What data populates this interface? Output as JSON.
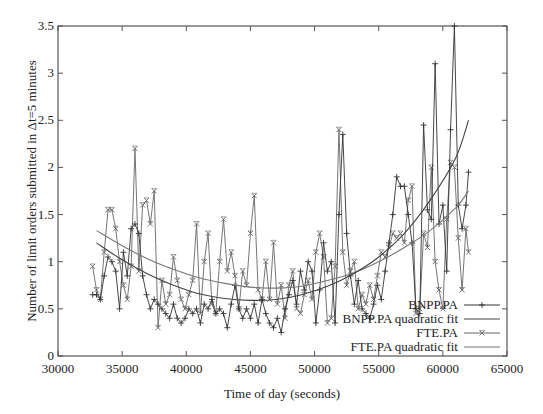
{
  "chart_data": {
    "type": "line",
    "title": "",
    "xlabel": "Time of day (seconds)",
    "ylabel": "Number of limit orders submitted in Δt=5 minutes",
    "xlim": [
      30000,
      65000
    ],
    "ylim": [
      0,
      3.5
    ],
    "grid": false,
    "legend_position": "bottom-right",
    "x_ticks": [
      "30000",
      "35000",
      "40000",
      "45000",
      "50000",
      "55000",
      "60000",
      "65000"
    ],
    "y_ticks": [
      "0",
      "0.5",
      "1",
      "1.5",
      "2",
      "2.5",
      "3",
      "3.5"
    ],
    "series": [
      {
        "name": "BNPP.PA",
        "marker": "+",
        "x": [
          32700,
          33000,
          33300,
          33600,
          33900,
          34200,
          34500,
          34800,
          35100,
          35400,
          35700,
          36000,
          36300,
          36600,
          36900,
          37200,
          37500,
          37800,
          38100,
          38400,
          38700,
          39000,
          39300,
          39600,
          39900,
          40200,
          40500,
          40800,
          41100,
          41400,
          41700,
          42000,
          42300,
          42600,
          42900,
          43200,
          43500,
          43800,
          44100,
          44400,
          44700,
          45000,
          45300,
          45600,
          45900,
          46200,
          46500,
          46800,
          47100,
          47400,
          47700,
          48000,
          48300,
          48600,
          48900,
          49200,
          49500,
          49800,
          50100,
          50400,
          50700,
          51000,
          51300,
          51600,
          51900,
          52200,
          52500,
          52800,
          53100,
          53400,
          53700,
          54000,
          54300,
          54600,
          54900,
          55200,
          55500,
          55800,
          56100,
          56400,
          56700,
          57000,
          57300,
          57600,
          57900,
          58200,
          58500,
          58800,
          59100,
          59400,
          59700,
          60000,
          60300,
          60600,
          60900,
          61200,
          61500,
          61800,
          62000
        ],
        "values": [
          0.65,
          0.65,
          0.6,
          0.85,
          1.05,
          1.0,
          0.9,
          0.5,
          1.1,
          0.85,
          1.35,
          1.4,
          1.3,
          0.85,
          0.65,
          0.5,
          0.6,
          0.55,
          0.5,
          0.45,
          0.4,
          0.55,
          0.4,
          0.35,
          0.4,
          0.5,
          0.45,
          0.5,
          0.35,
          0.55,
          0.5,
          0.6,
          0.45,
          0.5,
          0.45,
          0.3,
          0.55,
          0.75,
          0.5,
          0.4,
          0.5,
          0.4,
          0.55,
          0.35,
          0.6,
          0.45,
          0.35,
          0.3,
          0.4,
          0.25,
          0.5,
          0.65,
          0.8,
          0.55,
          0.9,
          0.7,
          1.0,
          0.9,
          0.35,
          0.7,
          1.2,
          0.9,
          1.0,
          0.35,
          1.5,
          2.35,
          1.3,
          0.85,
          0.55,
          0.8,
          0.5,
          0.45,
          0.4,
          0.55,
          0.75,
          0.6,
          0.9,
          1.2,
          1.5,
          1.9,
          1.8,
          1.8,
          1.5,
          1.2,
          0.5,
          0.45,
          2.45,
          1.55,
          1.45,
          3.1,
          1.4,
          1.6,
          0.9,
          2.4,
          3.5,
          1.6,
          1.35,
          1.6,
          1.95
        ]
      },
      {
        "name": "BNPP.PA quadratic fit",
        "marker": "none",
        "x": [
          33000,
          35000,
          37000,
          39000,
          41000,
          43000,
          45000,
          47000,
          49000,
          51000,
          53000,
          55000,
          57000,
          59000,
          61000,
          62000
        ],
        "values": [
          1.2,
          1.02,
          0.87,
          0.75,
          0.66,
          0.61,
          0.59,
          0.6,
          0.65,
          0.74,
          0.87,
          1.05,
          1.3,
          1.65,
          2.1,
          2.5
        ]
      },
      {
        "name": "FTE.PA",
        "marker": "×",
        "x": [
          32700,
          33000,
          33300,
          33600,
          33900,
          34200,
          34500,
          34800,
          35100,
          35400,
          35700,
          36000,
          36300,
          36600,
          36900,
          37200,
          37500,
          37800,
          38100,
          38400,
          38700,
          39000,
          39300,
          39600,
          39900,
          40200,
          40500,
          40800,
          41100,
          41400,
          41700,
          42000,
          42300,
          42600,
          42900,
          43200,
          43500,
          43800,
          44100,
          44400,
          44700,
          45000,
          45300,
          45600,
          45900,
          46200,
          46500,
          46800,
          47100,
          47400,
          47700,
          48000,
          48300,
          48600,
          48900,
          49200,
          49500,
          49800,
          50100,
          50400,
          50700,
          51000,
          51300,
          51600,
          51900,
          52200,
          52500,
          52800,
          53100,
          53400,
          53700,
          54000,
          54300,
          54600,
          54900,
          55200,
          55500,
          55800,
          56100,
          56400,
          56700,
          57000,
          57300,
          57600,
          57900,
          58200,
          58500,
          58800,
          59100,
          59400,
          59700,
          60000,
          60300,
          60600,
          60900,
          61200,
          61500,
          61800,
          62000
        ],
        "values": [
          0.95,
          0.7,
          0.6,
          1.1,
          1.55,
          1.55,
          1.35,
          1.0,
          0.75,
          0.6,
          0.95,
          2.2,
          0.9,
          1.6,
          1.65,
          1.4,
          1.75,
          0.3,
          0.8,
          0.55,
          0.65,
          1.05,
          0.8,
          0.6,
          0.5,
          0.65,
          0.8,
          1.4,
          0.45,
          1.0,
          1.3,
          0.55,
          0.45,
          1.0,
          1.45,
          0.9,
          1.1,
          0.85,
          0.5,
          0.9,
          0.75,
          1.3,
          1.7,
          0.7,
          0.6,
          1.0,
          0.6,
          1.2,
          0.55,
          0.75,
          0.4,
          0.75,
          0.9,
          0.5,
          0.45,
          0.65,
          0.8,
          0.6,
          1.1,
          1.3,
          1.05,
          0.35,
          0.4,
          0.95,
          2.4,
          1.1,
          0.75,
          0.9,
          1.0,
          0.5,
          0.65,
          0.55,
          0.75,
          0.6,
          0.85,
          1.1,
          1.05,
          1.15,
          1.3,
          1.25,
          1.3,
          1.2,
          1.65,
          1.8,
          0.45,
          0.5,
          1.3,
          1.15,
          2.0,
          1.0,
          0.7,
          0.5,
          1.45,
          2.05,
          2.0,
          1.25,
          0.7,
          1.35,
          1.1
        ]
      },
      {
        "name": "FTE.PA quadratic fit",
        "marker": "none",
        "x": [
          33000,
          35000,
          37000,
          39000,
          41000,
          43000,
          45000,
          47000,
          49000,
          51000,
          53000,
          55000,
          57000,
          59000,
          61000,
          62000
        ],
        "values": [
          1.33,
          1.17,
          1.03,
          0.92,
          0.83,
          0.77,
          0.73,
          0.72,
          0.74,
          0.8,
          0.88,
          1.0,
          1.15,
          1.33,
          1.57,
          1.75
        ]
      }
    ]
  },
  "legend": {
    "items": [
      {
        "label": "BNPP.PA",
        "style": "line-plus"
      },
      {
        "label": "BNPP.PA quadratic fit",
        "style": "line"
      },
      {
        "label": "FTE.PA",
        "style": "line-cross"
      },
      {
        "label": "FTE.PA quadratic fit",
        "style": "line"
      }
    ]
  },
  "colors": {
    "axis": "#555555",
    "bnpp": "#333333",
    "bnpp_fit": "#444444",
    "fte": "#666666",
    "fte_fit": "#777777"
  }
}
